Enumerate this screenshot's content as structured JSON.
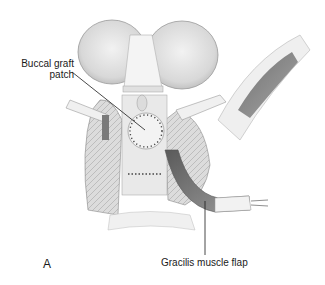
{
  "figure": {
    "panel_letter": "A",
    "labels": [
      {
        "id": "buccal",
        "line1": "Buccal graft",
        "line2": "patch"
      },
      {
        "id": "gracilis",
        "text": "Gracilis muscle flap"
      }
    ],
    "colors": {
      "background": "#ffffff",
      "ink": "#1a1a1a",
      "tissue_light": "#e6e6e6",
      "tissue_mid": "#bdbdbd",
      "muscle_dark": "#6e6e6e"
    }
  }
}
